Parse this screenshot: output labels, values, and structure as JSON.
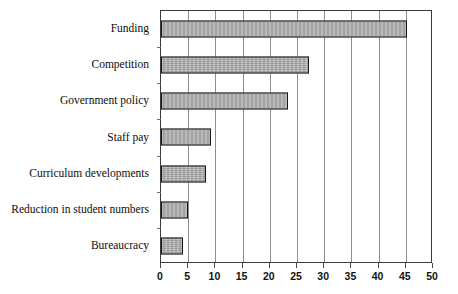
{
  "chart_data": {
    "type": "bar",
    "orientation": "horizontal",
    "title": "",
    "subtitle": "",
    "xlabel": "",
    "ylabel": "",
    "categories": [
      "Funding",
      "Competition",
      "Government policy",
      "Staff pay",
      "Curriculum developments",
      "Reduction in student numbers",
      "Bureaucracy"
    ],
    "values": [
      45.3,
      27.2,
      23.4,
      9.2,
      8.2,
      5.0,
      4.0
    ],
    "xlim": [
      0,
      50
    ],
    "xticks": [
      0,
      5,
      10,
      15,
      20,
      25,
      30,
      35,
      40,
      45,
      50
    ],
    "xtick_labels": [
      "0",
      "5",
      "10",
      "15",
      "20",
      "25",
      "30",
      "35",
      "40",
      "45",
      "50"
    ],
    "grid": "vertical",
    "legend": "none",
    "series": [
      {
        "name": "Responses",
        "values": [
          45.3,
          27.2,
          23.4,
          9.2,
          8.2,
          5.0,
          4.0
        ]
      }
    ],
    "colors": {
      "bar_fill": "#a9a9a9",
      "bar_border": "#161616",
      "gridline": "#8d8d8d",
      "frame": "#3a3a3a",
      "text": "#101010",
      "background": "#ffffff"
    }
  }
}
